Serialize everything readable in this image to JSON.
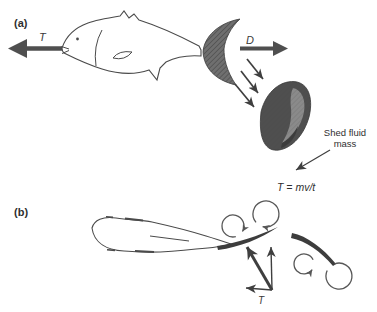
{
  "figure": {
    "panel_a": {
      "label": "(a)",
      "thrust_label": "T",
      "drag_label": "D",
      "shed_fluid_line1": "Shed fluid",
      "shed_fluid_line2": "mass",
      "equation": "T = mv/t"
    },
    "panel_b": {
      "label": "(b)",
      "thrust_label": "T"
    },
    "colors": {
      "ink": "#4a4a4a",
      "caudal_fin_fill": "#6f6f6f",
      "shed_mass_dark": "#4f4f4f",
      "shed_mass_light": "#8a8a8a",
      "shed_mass_fold": "#3c3c3c",
      "tail_blade_fill": "#3d3d3d",
      "arrow_fill": "#4f4f4f"
    }
  }
}
